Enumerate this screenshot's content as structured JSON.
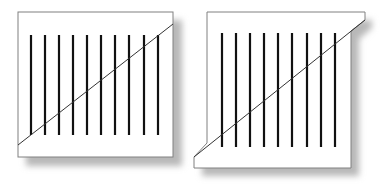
{
  "figure": {
    "type": "poggendorff-illusion",
    "background": "#ffffff",
    "stroke_color": "#111111",
    "frame_color": "#777777",
    "shadow_color": "#bdbdbd",
    "left_panel": {
      "name": "intact-diagonal-panel",
      "line_count": 10,
      "description": "Square frame with 10 vertical bars crossed by a continuous diagonal"
    },
    "right_panel": {
      "name": "cut-corner-panel",
      "line_count": 9,
      "description": "Frame with diagonally cut corners; 9 vertical bars crossed by a diagonal"
    }
  }
}
